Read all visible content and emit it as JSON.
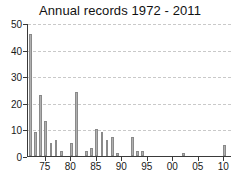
{
  "chart_data": {
    "type": "bar",
    "title": "Annual records 1972 - 2011",
    "xlabel": "",
    "ylabel": "",
    "ylim": [
      0,
      50
    ],
    "xlim": [
      1971.5,
      2011.5
    ],
    "grid": true,
    "legend": null,
    "y_ticks": [
      0,
      10,
      20,
      30,
      40,
      50
    ],
    "y_tick_labels": [
      "0",
      "10",
      "20",
      "30",
      "40",
      "50"
    ],
    "x_ticks": [
      1975,
      1980,
      1985,
      1990,
      1995,
      2000,
      2005,
      2010
    ],
    "x_tick_labels": [
      "75",
      "80",
      "85",
      "90",
      "95",
      "00",
      "05",
      "10"
    ],
    "bar_color": "#b0b0b0",
    "bar_edge_color": "#8a8a8a",
    "axis_color": "#3a3a3a",
    "grid_color": "#c9c9c9",
    "categories": [
      1972,
      1973,
      1974,
      1975,
      1976,
      1977,
      1978,
      1979,
      1980,
      1981,
      1982,
      1983,
      1984,
      1985,
      1986,
      1987,
      1988,
      1989,
      1990,
      1991,
      1992,
      1993,
      1994,
      1995,
      1996,
      1997,
      1998,
      1999,
      2000,
      2001,
      2002,
      2003,
      2004,
      2005,
      2006,
      2007,
      2008,
      2009,
      2010,
      2011
    ],
    "values": [
      46,
      9,
      23,
      13,
      5,
      6,
      2,
      0,
      5,
      24,
      0,
      2,
      3,
      10,
      9,
      6,
      7,
      1,
      0,
      0,
      7,
      2,
      2,
      0,
      0,
      0,
      0,
      0,
      0,
      0,
      1,
      0,
      0,
      0,
      0,
      0,
      0,
      0,
      4,
      0
    ]
  }
}
